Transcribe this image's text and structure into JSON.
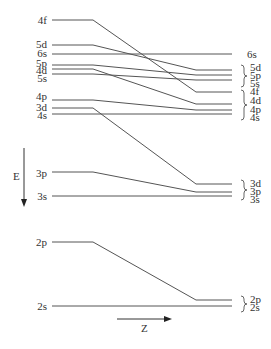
{
  "diagram": {
    "axes": {
      "energy": {
        "label": "E",
        "direction": "down"
      },
      "z": {
        "label": "Z",
        "direction": "right"
      }
    },
    "left_labels": [
      "4f",
      "5d",
      "6s",
      "5p",
      "4d",
      "5s",
      "4p",
      "3d",
      "4s",
      "3p",
      "3s",
      "2p",
      "2s"
    ],
    "right_labels": [
      "6s",
      "5d",
      "5p",
      "5s",
      "4f",
      "4d",
      "4p",
      "4s",
      "3d",
      "3p",
      "3s",
      "2p",
      "2s"
    ],
    "shell_groups": [
      {
        "name": "n=5 group",
        "members": [
          "5d",
          "5p",
          "5s"
        ]
      },
      {
        "name": "n=4 group",
        "members": [
          "4f",
          "4d",
          "4p",
          "4s"
        ]
      },
      {
        "name": "n=3 group",
        "members": [
          "3d",
          "3p",
          "3s"
        ]
      },
      {
        "name": "n=2 group",
        "members": [
          "2p",
          "2s"
        ]
      }
    ],
    "levels": [
      {
        "orbital": "4f",
        "left_y": 20,
        "bend_x": 93,
        "right_y": 92
      },
      {
        "orbital": "5d",
        "left_y": 45,
        "bend_x": 93,
        "right_y": 70
      },
      {
        "orbital": "6s",
        "left_y": 54,
        "bend_x": 93,
        "right_y": 54
      },
      {
        "orbital": "5p",
        "left_y": 65,
        "bend_x": 93,
        "right_y": 75
      },
      {
        "orbital": "4d",
        "left_y": 69,
        "bend_x": 93,
        "right_y": 104
      },
      {
        "orbital": "5s",
        "left_y": 74,
        "bend_x": 93,
        "right_y": 80
      },
      {
        "orbital": "4p",
        "left_y": 100,
        "bend_x": 93,
        "right_y": 110
      },
      {
        "orbital": "3d",
        "left_y": 108,
        "bend_x": 93,
        "right_y": 184
      },
      {
        "orbital": "4s",
        "left_y": 114,
        "bend_x": 93,
        "right_y": 114
      },
      {
        "orbital": "3p",
        "left_y": 172,
        "bend_x": 93,
        "right_y": 192
      },
      {
        "orbital": "3s",
        "left_y": 196,
        "bend_x": 93,
        "right_y": 196
      },
      {
        "orbital": "2p",
        "left_y": 242,
        "bend_x": 93,
        "right_y": 300
      },
      {
        "orbital": "2s",
        "left_y": 306,
        "bend_x": 93,
        "right_y": 306
      }
    ]
  }
}
